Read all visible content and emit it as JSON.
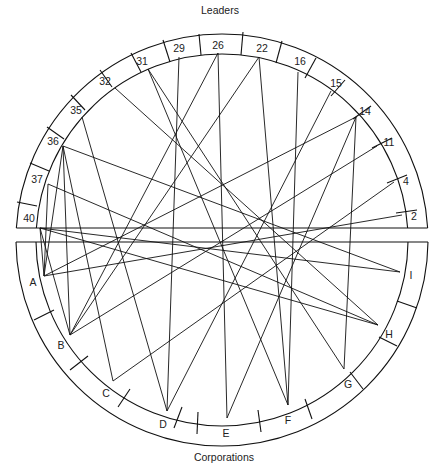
{
  "title_top": "Leaders",
  "title_bottom": "Corporations",
  "colors": {
    "ink": "#111111",
    "background": "#ffffff"
  },
  "geometry": {
    "cx": 222,
    "cy": 240,
    "r_outer": 206,
    "r_inner": 186,
    "gap_top_y": 228,
    "gap_bottom_y": 242
  },
  "leaders": [
    {
      "id": "40",
      "label": "40",
      "x": 40,
      "y": 228,
      "lx": 29,
      "ly": 219
    },
    {
      "id": "37",
      "label": "37",
      "x": 48,
      "y": 184,
      "lx": 37,
      "ly": 180
    },
    {
      "id": "36",
      "label": "36",
      "x": 63,
      "y": 146,
      "lx": 53,
      "ly": 142
    },
    {
      "id": "35",
      "label": "35",
      "x": 82,
      "y": 117,
      "lx": 76,
      "ly": 111
    },
    {
      "id": "32",
      "label": "32",
      "x": 115,
      "y": 88,
      "lx": 105,
      "ly": 82
    },
    {
      "id": "31",
      "label": "31",
      "x": 148,
      "y": 69,
      "lx": 142,
      "ly": 62
    },
    {
      "id": "29",
      "label": "29",
      "x": 179,
      "y": 57,
      "lx": 179,
      "ly": 49
    },
    {
      "id": "26",
      "label": "26",
      "x": 218,
      "y": 53,
      "lx": 218,
      "ly": 46
    },
    {
      "id": "22",
      "label": "22",
      "x": 259,
      "y": 57,
      "lx": 262,
      "ly": 49
    },
    {
      "id": "16",
      "label": "16",
      "x": 298,
      "y": 72,
      "lx": 300,
      "ly": 62
    },
    {
      "id": "15",
      "label": "15",
      "x": 331,
      "y": 91,
      "lx": 336,
      "ly": 84
    },
    {
      "id": "14",
      "label": "14",
      "x": 356,
      "y": 117,
      "lx": 365,
      "ly": 112
    },
    {
      "id": "11",
      "label": "11",
      "x": 377,
      "y": 146,
      "lx": 389,
      "ly": 143
    },
    {
      "id": "4",
      "label": "4",
      "x": 394,
      "y": 182,
      "lx": 406,
      "ly": 182
    },
    {
      "id": "2",
      "label": "2",
      "x": 402,
      "y": 215,
      "lx": 414,
      "ly": 217
    }
  ],
  "corporations": [
    {
      "id": "A",
      "label": "A",
      "x": 44,
      "y": 276,
      "lx": 33,
      "ly": 283
    },
    {
      "id": "B",
      "label": "B",
      "x": 70,
      "y": 335,
      "lx": 61,
      "ly": 346
    },
    {
      "id": "C",
      "label": "C",
      "x": 113,
      "y": 381,
      "lx": 106,
      "ly": 394
    },
    {
      "id": "D",
      "label": "D",
      "x": 167,
      "y": 411,
      "lx": 163,
      "ly": 425
    },
    {
      "id": "E",
      "label": "E",
      "x": 227,
      "y": 418,
      "lx": 226,
      "ly": 434
    },
    {
      "id": "F",
      "label": "F",
      "x": 288,
      "y": 405,
      "lx": 288,
      "ly": 421
    },
    {
      "id": "G",
      "label": "G",
      "x": 344,
      "y": 369,
      "lx": 348,
      "ly": 385
    },
    {
      "id": "H",
      "label": "H",
      "x": 378,
      "y": 325,
      "lx": 389,
      "ly": 335
    },
    {
      "id": "I",
      "label": "I",
      "x": 400,
      "y": 272,
      "lx": 411,
      "ly": 276
    }
  ],
  "segment_ticks_top": [
    [
      17,
      202,
      37,
      206
    ],
    [
      30,
      163,
      49,
      171
    ],
    [
      47,
      127,
      64,
      139
    ],
    [
      71,
      95,
      85,
      110
    ],
    [
      100,
      70,
      112,
      87
    ],
    [
      131,
      53,
      141,
      72
    ],
    [
      163,
      40,
      170,
      62
    ],
    [
      199,
      34,
      201,
      55
    ],
    [
      243,
      32,
      241,
      55
    ],
    [
      282,
      41,
      276,
      63
    ],
    [
      316,
      58,
      305,
      78
    ],
    [
      345,
      80,
      331,
      96
    ],
    [
      371,
      106,
      353,
      119
    ],
    [
      392,
      138,
      372,
      148
    ],
    [
      407,
      175,
      387,
      183
    ],
    [
      417,
      210,
      396,
      213
    ]
  ],
  "segment_ticks_bottom": [
    [
      34,
      320,
      54,
      310
    ],
    [
      70,
      370,
      88,
      356
    ],
    [
      118,
      407,
      130,
      389
    ],
    [
      174,
      428,
      182,
      407
    ],
    [
      197,
      434,
      198,
      412
    ],
    [
      261,
      432,
      258,
      410
    ],
    [
      312,
      419,
      305,
      399
    ],
    [
      363,
      389,
      350,
      372
    ],
    [
      397,
      346,
      379,
      337
    ],
    [
      417,
      308,
      397,
      301
    ]
  ],
  "connections": [
    [
      "40",
      "A"
    ],
    [
      "40",
      "B"
    ],
    [
      "40",
      "H"
    ],
    [
      "40",
      "I"
    ],
    [
      "37",
      "A"
    ],
    [
      "37",
      "H"
    ],
    [
      "36",
      "A"
    ],
    [
      "36",
      "B"
    ],
    [
      "36",
      "C"
    ],
    [
      "36",
      "I"
    ],
    [
      "35",
      "D"
    ],
    [
      "32",
      "H"
    ],
    [
      "31",
      "F"
    ],
    [
      "31",
      "G"
    ],
    [
      "29",
      "D"
    ],
    [
      "26",
      "B"
    ],
    [
      "26",
      "E"
    ],
    [
      "22",
      "B"
    ],
    [
      "22",
      "F"
    ],
    [
      "16",
      "F"
    ],
    [
      "15",
      "D"
    ],
    [
      "14",
      "E"
    ],
    [
      "14",
      "G"
    ],
    [
      "14",
      "A"
    ],
    [
      "11",
      "B"
    ],
    [
      "4",
      "C"
    ],
    [
      "2",
      "A"
    ]
  ]
}
